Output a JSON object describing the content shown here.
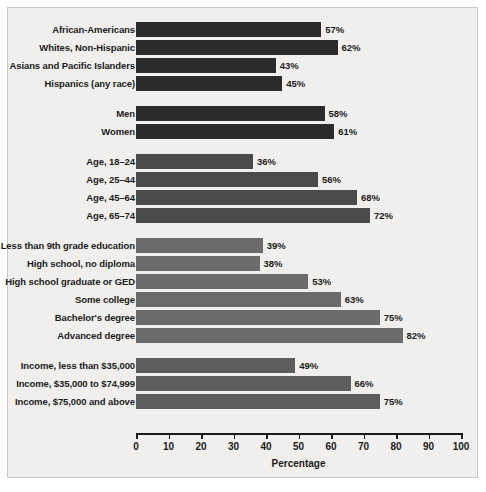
{
  "chart_data": {
    "type": "bar",
    "orientation": "horizontal",
    "title": "",
    "xlabel": "Percentage",
    "ylabel": "",
    "xlim": [
      0,
      100
    ],
    "xticks": [
      0,
      10,
      20,
      30,
      40,
      50,
      60,
      70,
      80,
      90,
      100
    ],
    "grid": false,
    "legend": "none",
    "value_suffix": "%",
    "groups": [
      {
        "name": "race-ethnicity",
        "color": "#2b2b2b",
        "categories": [
          "African-Americans",
          "Whites, Non-Hispanic",
          "Asians and Pacific Islanders",
          "Hispanics (any race)"
        ],
        "values": [
          57,
          62,
          43,
          45
        ],
        "labels": [
          "57%",
          "62%",
          "43%",
          "45%"
        ]
      },
      {
        "name": "sex",
        "color": "#2b2b2b",
        "categories": [
          "Men",
          "Women"
        ],
        "values": [
          58,
          61
        ],
        "labels": [
          "58%",
          "61%"
        ]
      },
      {
        "name": "age",
        "color": "#4a4a4a",
        "categories": [
          "Age, 18–24",
          "Age, 25–44",
          "Age, 45–64",
          "Age, 65–74"
        ],
        "values": [
          36,
          56,
          68,
          72
        ],
        "labels": [
          "36%",
          "56%",
          "68%",
          "72%"
        ]
      },
      {
        "name": "education",
        "color": "#6b6b6b",
        "categories": [
          "Less than 9th grade education",
          "High school, no diploma",
          "High school graduate or GED",
          "Some college",
          "Bachelor's degree",
          "Advanced degree"
        ],
        "values": [
          39,
          38,
          53,
          63,
          75,
          82
        ],
        "labels": [
          "39%",
          "38%",
          "53%",
          "63%",
          "75%",
          "82%"
        ]
      },
      {
        "name": "income",
        "color": "#5d5d5d",
        "categories": [
          "Income, less than $35,000",
          "Income, $35,000 to $74,999",
          "Income, $75,000 and above"
        ],
        "values": [
          49,
          66,
          75
        ],
        "labels": [
          "49%",
          "66%",
          "75%"
        ]
      }
    ]
  }
}
